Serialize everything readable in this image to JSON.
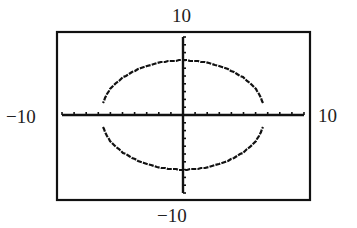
{
  "chart_data": {
    "type": "line",
    "title": "",
    "window": {
      "xmin": -10,
      "xmax": 10,
      "ymin": -10,
      "ymax": 10,
      "xscl": 1,
      "yscl": 1
    },
    "xlabel": "",
    "ylabel": "",
    "xlim": [
      -10,
      10
    ],
    "ylim": [
      -10,
      10
    ],
    "grid": false,
    "legend": null,
    "window_labels": {
      "top": "10",
      "bottom": "−10",
      "left": "−10",
      "right": "10"
    },
    "series": [
      {
        "name": "ellipse",
        "shape": "ellipse",
        "center": [
          0,
          0
        ],
        "semi_axis_x": 6.8,
        "semi_axis_y": 7,
        "gap_near_x_axis": true,
        "points_upper": [
          [
            -6.8,
            1.5
          ],
          [
            -6,
            3.4
          ],
          [
            -4,
            5.7
          ],
          [
            -2,
            6.7
          ],
          [
            0,
            7
          ],
          [
            2,
            6.7
          ],
          [
            4,
            5.7
          ],
          [
            6,
            3.4
          ],
          [
            6.8,
            1.5
          ]
        ],
        "points_lower": [
          [
            -6.8,
            -1.5
          ],
          [
            -6,
            -3.4
          ],
          [
            -4,
            -5.7
          ],
          [
            -2,
            -6.7
          ],
          [
            0,
            -7
          ],
          [
            2,
            -6.7
          ],
          [
            4,
            -5.7
          ],
          [
            6,
            -3.4
          ],
          [
            6.8,
            -1.5
          ]
        ]
      }
    ],
    "colors": {
      "foreground": "#111111",
      "background": "#ffffff"
    }
  }
}
